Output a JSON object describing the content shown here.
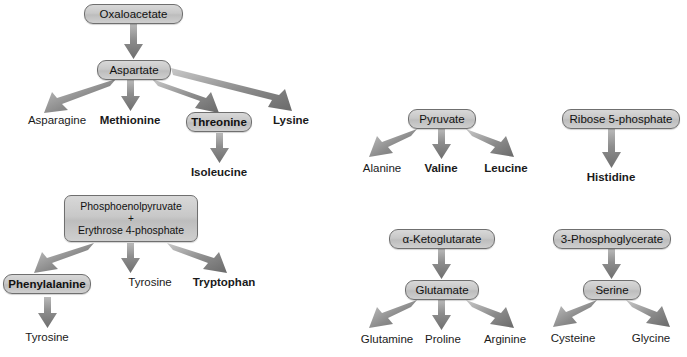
{
  "diagram": {
    "colors": {
      "box_fill_top": "#d8d8d8",
      "box_fill_bottom": "#cfcfcf",
      "box_border": "#6f6f6f",
      "arrow": "#777777",
      "text": "#1a1a1a",
      "background": "#ffffff"
    },
    "legend_note": "Bold labels denote essential amino acids"
  },
  "clusters": {
    "oxaloacetate": {
      "precursor": "Oxaloacetate",
      "intermediate": "Aspartate",
      "products": [
        {
          "label": "Asparagine",
          "bold": false,
          "boxed": false
        },
        {
          "label": "Methionine",
          "bold": true,
          "boxed": false
        },
        {
          "label": "Threonine",
          "bold": true,
          "boxed": true
        },
        {
          "label": "Lysine",
          "bold": true,
          "boxed": false
        }
      ],
      "sub_products": [
        {
          "from": "Threonine",
          "label": "Isoleucine",
          "bold": true,
          "boxed": false
        }
      ]
    },
    "pep_e4p": {
      "precursor_lines": [
        "Phosphoenolpyruvate",
        "+",
        "Erythrose 4-phosphate"
      ],
      "products": [
        {
          "label": "Phenylalanine",
          "bold": true,
          "boxed": true
        },
        {
          "label": "Tyrosine",
          "bold": false,
          "boxed": false
        },
        {
          "label": "Tryptophan",
          "bold": true,
          "boxed": false
        }
      ],
      "sub_products": [
        {
          "from": "Phenylalanine",
          "label": "Tyrosine",
          "bold": false,
          "boxed": false
        }
      ]
    },
    "pyruvate": {
      "precursor": "Pyruvate",
      "products": [
        {
          "label": "Alanine",
          "bold": false,
          "boxed": false
        },
        {
          "label": "Valine",
          "bold": true,
          "boxed": false
        },
        {
          "label": "Leucine",
          "bold": true,
          "boxed": false
        }
      ]
    },
    "ketoglutarate": {
      "precursor": "α-Ketoglutarate",
      "intermediate": "Glutamate",
      "products": [
        {
          "label": "Glutamine",
          "bold": false,
          "boxed": false
        },
        {
          "label": "Proline",
          "bold": false,
          "boxed": false
        },
        {
          "label": "Arginine",
          "bold": false,
          "boxed": false
        }
      ]
    },
    "ribose5p": {
      "precursor": "Ribose 5-phosphate",
      "products": [
        {
          "label": "Histidine",
          "bold": true,
          "boxed": false
        }
      ]
    },
    "phosphoglycerate": {
      "precursor": "3-Phosphoglycerate",
      "intermediate": "Serine",
      "products": [
        {
          "label": "Cysteine",
          "bold": false,
          "boxed": false
        },
        {
          "label": "Glycine",
          "bold": false,
          "boxed": false
        }
      ]
    }
  }
}
